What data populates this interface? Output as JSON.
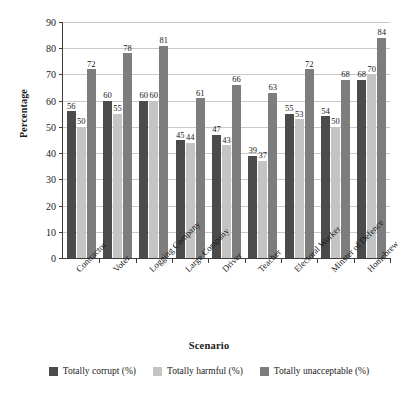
{
  "chart_data": {
    "type": "bar",
    "title": "",
    "xlabel": "Scenario",
    "ylabel": "Percentage",
    "ylim": [
      0,
      90
    ],
    "ytick_step": 10,
    "yticks": [
      0,
      10,
      20,
      30,
      40,
      50,
      60,
      70,
      80,
      90
    ],
    "grid": true,
    "legend_position": "bottom",
    "categories": [
      "Contractor",
      "Voter",
      "Logging Company",
      "Large Company",
      "Driver",
      "Teacher",
      "Electoral Worker",
      "Minster of Defence",
      "Homebrew"
    ],
    "series": [
      {
        "name": "Totally corrupt (%)",
        "color": "#4b4b4b",
        "values": [
          56,
          60,
          60,
          45,
          47,
          39,
          55,
          54,
          68
        ]
      },
      {
        "name": "Totally harmful (%)",
        "color": "#c4c4c4",
        "values": [
          50,
          55,
          60,
          44,
          43,
          37,
          53,
          50,
          70
        ]
      },
      {
        "name": "Totally unacceptable (%)",
        "color": "#7d7d7d",
        "values": [
          72,
          78,
          81,
          61,
          66,
          63,
          72,
          68,
          84
        ]
      }
    ]
  },
  "axes": {
    "y_title": "Percentage",
    "x_title": "Scenario"
  },
  "colors": {
    "axis": "#3b3b3b",
    "gridline": "#c9c9c9",
    "background": "#ffffff",
    "series_corrupt": "#4b4b4b",
    "series_harmful": "#c4c4c4",
    "series_unacceptable": "#7d7d7d"
  }
}
